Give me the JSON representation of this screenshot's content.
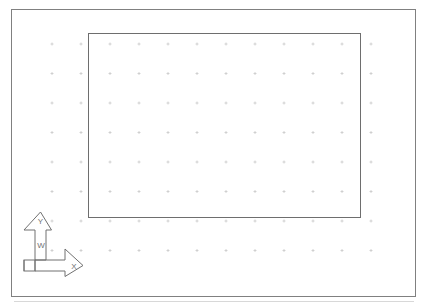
{
  "app": {
    "title": "CAD Drawing Area",
    "background_color": "#ffffff"
  },
  "viewport": {
    "name": "drawing-viewport",
    "border_color": "#808080",
    "border_width": 1,
    "x": 11,
    "y": 9,
    "width": 404,
    "height": 287
  },
  "baseline": {
    "name": "lower-edge-line",
    "color": "#d8d8d8",
    "y": 301,
    "x1": 14,
    "x2": 414
  },
  "grid": {
    "name": "snap-grid",
    "visible": true,
    "mark_style": "cross",
    "mark_color": "#c9c9c9",
    "mark_size": 3,
    "origin_x": 52,
    "origin_y": 44,
    "spacing_x": 29,
    "spacing_y": 29.5,
    "columns": 12,
    "rows": 8
  },
  "entities": [
    {
      "name": "rectangle-entity",
      "type": "rectangle",
      "stroke_color": "#6e6e6e",
      "stroke_width": 1,
      "x": 88,
      "y": 33,
      "width": 272,
      "height": 184
    }
  ],
  "ucs_icon": {
    "name": "wcs-coordinate-icon",
    "type": "2d-wcs",
    "stroke_color": "#707070",
    "stroke_width": 1,
    "origin_x": 35,
    "origin_y": 260,
    "labels": {
      "y_axis": "Y",
      "x_axis": "X",
      "world": "W"
    },
    "label_color": "#707070",
    "label_font_size": 8
  }
}
